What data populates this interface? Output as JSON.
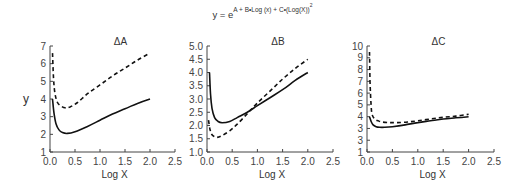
{
  "formula": {
    "lhs": "y = e",
    "exponent": "A + B•Log (x) + C•(Log(X))",
    "exponent_power": "2"
  },
  "chart_data": [
    {
      "type": "line",
      "title": "ΔA",
      "xlabel": "Log X",
      "ylabel": "y",
      "xlim": [
        0.0,
        2.5
      ],
      "ylim": [
        1,
        7
      ],
      "xticks": [
        "0.0",
        "0.5",
        "1.0",
        "1.5",
        "2.0",
        "2.5"
      ],
      "yticks": [
        "1",
        "2",
        "3",
        "4",
        "5",
        "6",
        "7"
      ],
      "grid": false,
      "series": [
        {
          "name": "solid",
          "style": "solid",
          "x": [
            0.05,
            0.08,
            0.12,
            0.18,
            0.25,
            0.35,
            0.5,
            0.75,
            1.0,
            1.25,
            1.5,
            1.75,
            2.0
          ],
          "y": [
            4.0,
            3.2,
            2.6,
            2.25,
            2.1,
            2.05,
            2.15,
            2.45,
            2.8,
            3.15,
            3.45,
            3.75,
            4.0
          ]
        },
        {
          "name": "dashed",
          "style": "dashed",
          "x": [
            0.05,
            0.07,
            0.1,
            0.15,
            0.22,
            0.3,
            0.4,
            0.55,
            0.75,
            1.0,
            1.25,
            1.5,
            1.75,
            2.0
          ],
          "y": [
            6.6,
            5.2,
            4.3,
            3.8,
            3.6,
            3.5,
            3.55,
            3.8,
            4.3,
            4.8,
            5.3,
            5.75,
            6.2,
            6.6
          ]
        }
      ]
    },
    {
      "type": "line",
      "title": "ΔB",
      "xlabel": "Log X",
      "ylabel": "",
      "xlim": [
        0.0,
        2.5
      ],
      "ylim": [
        1.0,
        5.0
      ],
      "xticks": [
        "0.0",
        "0.5",
        "1.0",
        "1.5",
        "2.0",
        "2.5"
      ],
      "yticks": [
        "1.0",
        "1.5",
        "2.0",
        "2.5",
        "3.0",
        "3.5",
        "4.0",
        "4.5",
        "5.0"
      ],
      "grid": false,
      "series": [
        {
          "name": "solid",
          "style": "solid",
          "x": [
            0.05,
            0.07,
            0.1,
            0.15,
            0.22,
            0.3,
            0.45,
            0.6,
            0.8,
            1.0,
            1.25,
            1.5,
            1.75,
            2.0
          ],
          "y": [
            4.0,
            3.2,
            2.65,
            2.3,
            2.15,
            2.1,
            2.15,
            2.3,
            2.5,
            2.75,
            3.05,
            3.35,
            3.7,
            4.0
          ]
        },
        {
          "name": "dashed",
          "style": "dashed",
          "x": [
            0.03,
            0.06,
            0.1,
            0.15,
            0.2,
            0.3,
            0.45,
            0.6,
            0.8,
            1.0,
            1.25,
            1.5,
            1.75,
            2.0
          ],
          "y": [
            2.2,
            1.85,
            1.65,
            1.58,
            1.55,
            1.62,
            1.8,
            2.05,
            2.45,
            2.85,
            3.3,
            3.75,
            4.15,
            4.5
          ]
        }
      ]
    },
    {
      "type": "line",
      "title": "ΔC",
      "xlabel": "Log X",
      "ylabel": "",
      "xlim": [
        0.0,
        2.5
      ],
      "ylim": [
        1,
        10
      ],
      "xticks": [
        "0.0",
        "0.5",
        "1.0",
        "1.5",
        "2.0",
        "2.5"
      ],
      "yticks": [
        "1",
        "3",
        "3",
        "4",
        "5",
        "6",
        "7",
        "8",
        "9",
        "10"
      ],
      "grid": false,
      "series": [
        {
          "name": "solid",
          "style": "solid",
          "x": [
            0.05,
            0.08,
            0.12,
            0.18,
            0.25,
            0.35,
            0.5,
            0.75,
            1.0,
            1.25,
            1.5,
            1.75,
            2.0
          ],
          "y": [
            4.0,
            3.6,
            3.3,
            3.15,
            3.1,
            3.1,
            3.15,
            3.3,
            3.5,
            3.65,
            3.8,
            3.9,
            4.0
          ]
        },
        {
          "name": "dashed",
          "style": "dashed",
          "x": [
            0.05,
            0.06,
            0.08,
            0.1,
            0.15,
            0.22,
            0.3,
            0.45,
            0.6,
            0.8,
            1.0,
            1.25,
            1.5,
            1.75,
            2.0
          ],
          "y": [
            9.5,
            7.0,
            5.0,
            4.2,
            3.8,
            3.65,
            3.55,
            3.5,
            3.5,
            3.55,
            3.65,
            3.8,
            3.95,
            4.05,
            4.2
          ]
        }
      ]
    }
  ]
}
